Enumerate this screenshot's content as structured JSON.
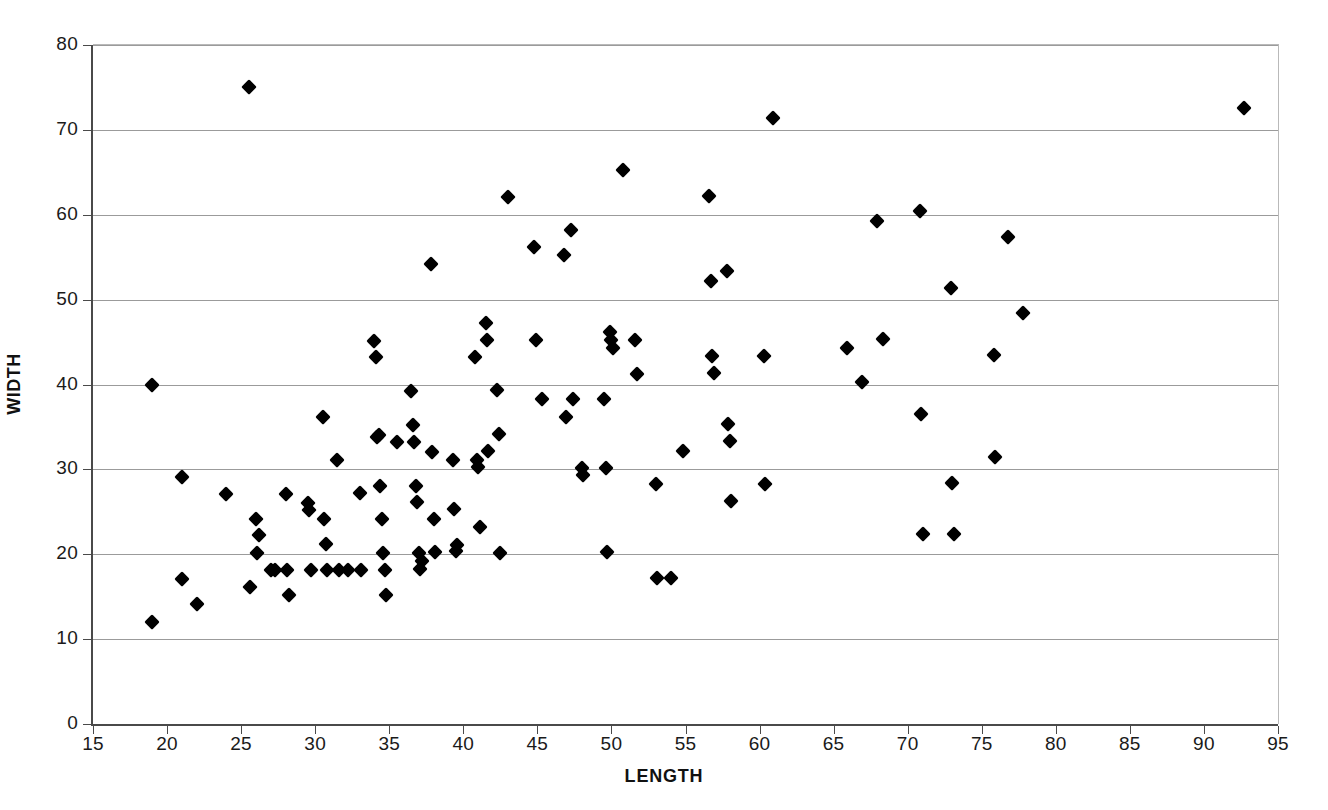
{
  "chart_data": {
    "type": "scatter",
    "title": "",
    "xlabel": "LENGTH",
    "ylabel": "WIDTH",
    "xlim": [
      15,
      95
    ],
    "ylim": [
      0,
      80
    ],
    "xticks": [
      15,
      20,
      25,
      30,
      35,
      40,
      45,
      50,
      55,
      60,
      65,
      70,
      75,
      80,
      85,
      90,
      95
    ],
    "yticks": [
      0,
      10,
      20,
      30,
      40,
      50,
      60,
      70,
      80
    ],
    "grid": "horizontal",
    "legend": "none",
    "marker": "diamond",
    "marker_color": "#000000",
    "point_count": 137,
    "points": [
      [
        19.0,
        40.0
      ],
      [
        19.0,
        12.0
      ],
      [
        21.0,
        29.1
      ],
      [
        21.0,
        17.1
      ],
      [
        22.0,
        14.1
      ],
      [
        24.0,
        27.1
      ],
      [
        25.5,
        75.0
      ],
      [
        25.6,
        16.1
      ],
      [
        26.0,
        24.2
      ],
      [
        26.2,
        22.3
      ],
      [
        26.1,
        20.1
      ],
      [
        27.0,
        18.2
      ],
      [
        27.3,
        18.2
      ],
      [
        28.0,
        27.1
      ],
      [
        28.1,
        18.2
      ],
      [
        28.2,
        15.2
      ],
      [
        29.5,
        26.0
      ],
      [
        29.6,
        25.2
      ],
      [
        29.7,
        18.2
      ],
      [
        30.5,
        36.2
      ],
      [
        30.6,
        24.1
      ],
      [
        30.7,
        21.2
      ],
      [
        30.8,
        18.2
      ],
      [
        31.5,
        31.1
      ],
      [
        31.6,
        18.2
      ],
      [
        32.2,
        18.2
      ],
      [
        33.0,
        27.2
      ],
      [
        33.1,
        18.2
      ],
      [
        34.0,
        45.1
      ],
      [
        34.1,
        43.2
      ],
      [
        34.2,
        33.8
      ],
      [
        34.3,
        34.0
      ],
      [
        34.4,
        28.1
      ],
      [
        34.5,
        24.1
      ],
      [
        34.6,
        20.2
      ],
      [
        34.7,
        18.2
      ],
      [
        34.8,
        15.2
      ],
      [
        35.5,
        33.2
      ],
      [
        36.5,
        39.2
      ],
      [
        36.6,
        35.2
      ],
      [
        36.7,
        33.2
      ],
      [
        36.8,
        28.1
      ],
      [
        36.9,
        26.1
      ],
      [
        37.0,
        20.2
      ],
      [
        37.1,
        18.3
      ],
      [
        37.2,
        19.2
      ],
      [
        37.8,
        54.2
      ],
      [
        37.9,
        32.1
      ],
      [
        38.0,
        24.1
      ],
      [
        38.1,
        20.3
      ],
      [
        39.3,
        31.1
      ],
      [
        39.4,
        25.3
      ],
      [
        39.5,
        20.4
      ],
      [
        39.6,
        21.1
      ],
      [
        40.8,
        43.2
      ],
      [
        40.9,
        31.1
      ],
      [
        41.0,
        30.3
      ],
      [
        41.1,
        23.2
      ],
      [
        41.5,
        47.2
      ],
      [
        41.6,
        45.2
      ],
      [
        41.7,
        32.2
      ],
      [
        42.3,
        39.3
      ],
      [
        42.4,
        34.2
      ],
      [
        42.5,
        20.2
      ],
      [
        43.0,
        62.1
      ],
      [
        44.8,
        56.2
      ],
      [
        44.9,
        45.2
      ],
      [
        45.3,
        38.3
      ],
      [
        46.8,
        55.3
      ],
      [
        46.9,
        36.2
      ],
      [
        47.3,
        58.2
      ],
      [
        47.4,
        38.3
      ],
      [
        48.0,
        30.2
      ],
      [
        48.1,
        29.3
      ],
      [
        49.5,
        38.3
      ],
      [
        49.6,
        30.2
      ],
      [
        49.7,
        20.3
      ],
      [
        49.9,
        46.2
      ],
      [
        50.0,
        45.3
      ],
      [
        50.1,
        44.3
      ],
      [
        50.8,
        65.3
      ],
      [
        51.6,
        45.2
      ],
      [
        51.7,
        41.2
      ],
      [
        53.0,
        28.3
      ],
      [
        53.1,
        17.2
      ],
      [
        54.0,
        17.2
      ],
      [
        54.8,
        32.2
      ],
      [
        56.6,
        62.2
      ],
      [
        56.7,
        52.2
      ],
      [
        56.8,
        43.3
      ],
      [
        56.9,
        41.3
      ],
      [
        57.8,
        53.4
      ],
      [
        57.9,
        35.4
      ],
      [
        58.0,
        33.3
      ],
      [
        58.1,
        26.3
      ],
      [
        60.3,
        43.4
      ],
      [
        60.4,
        28.3
      ],
      [
        60.9,
        71.4
      ],
      [
        65.9,
        44.3
      ],
      [
        66.9,
        40.3
      ],
      [
        67.9,
        59.3
      ],
      [
        68.3,
        45.4
      ],
      [
        70.8,
        60.4
      ],
      [
        70.9,
        36.5
      ],
      [
        71.0,
        22.4
      ],
      [
        72.9,
        51.4
      ],
      [
        73.0,
        28.4
      ],
      [
        73.1,
        22.4
      ],
      [
        75.8,
        43.5
      ],
      [
        75.9,
        31.4
      ],
      [
        76.8,
        57.4
      ],
      [
        77.8,
        48.4
      ],
      [
        92.7,
        72.6
      ]
    ]
  },
  "axis": {
    "x_title": "LENGTH",
    "y_title": "WIDTH",
    "x_tick_labels": [
      "15",
      "20",
      "25",
      "30",
      "35",
      "40",
      "45",
      "50",
      "55",
      "60",
      "65",
      "70",
      "75",
      "80",
      "85",
      "90",
      "95"
    ],
    "y_tick_labels": [
      "80",
      "70",
      "60",
      "50",
      "40",
      "30",
      "20",
      "10",
      "0"
    ]
  },
  "colors": {
    "marker": "#000000",
    "gridline": "#9b9b9b",
    "axis": "#4a4a4a",
    "frame": "#b9b9b9",
    "background": "#ffffff",
    "text": "#1a1a1a"
  }
}
